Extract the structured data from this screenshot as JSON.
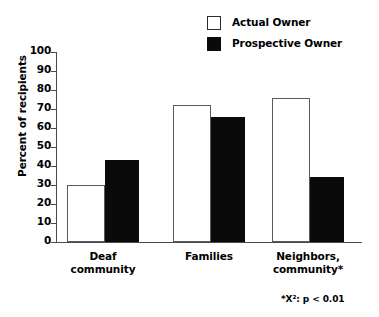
{
  "chart_data": {
    "type": "bar",
    "title": "",
    "xlabel": "",
    "ylabel": "Percent of recipients",
    "ylim": [
      0,
      100
    ],
    "ytick_step": 10,
    "grid": false,
    "legend_position": "top-right",
    "categories": [
      "Deaf community",
      "Families",
      "Neighbors, community*"
    ],
    "ytick_labels": [
      "100",
      "90",
      "80",
      "70",
      "60",
      "50",
      "40",
      "30",
      "20",
      "10",
      "0"
    ],
    "series": [
      {
        "name": "Actual Owner",
        "style": "open",
        "color": "#ffffff",
        "edge_color": "#5a5a5a",
        "values": [
          30,
          72,
          76
        ]
      },
      {
        "name": "Prospective Owner",
        "style": "filled",
        "color": "#0a0a0a",
        "edge_color": "#0a0a0a",
        "values": [
          43,
          66,
          34
        ]
      }
    ],
    "annotations": [
      "*X²:  p < 0.01"
    ]
  },
  "legend": {
    "items": [
      {
        "label": "Actual Owner",
        "swatch": "open-square-swatch"
      },
      {
        "label": "Prospective Owner",
        "swatch": "filled-square-swatch"
      }
    ]
  },
  "axis": {
    "y_title": "Percent of recipients"
  },
  "categories_display": [
    {
      "line1": "Deaf",
      "line2": "community"
    },
    {
      "line1": "Families",
      "line2": ""
    },
    {
      "line1": "Neighbors,",
      "line2": "community*"
    }
  ],
  "footnote": "*X²:  p < 0.01"
}
